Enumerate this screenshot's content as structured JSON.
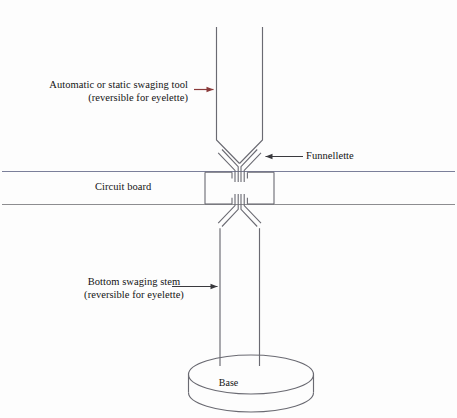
{
  "diagram": {
    "background_color": "#fdfdfd",
    "labels": {
      "tool": {
        "line1": "Automatic or static swaging tool",
        "line2": "(reversible for eyelette)"
      },
      "funnellette": "Funnellette",
      "circuit_board": "Circuit board",
      "stem": {
        "line1": "Bottom swaging stem",
        "line2": "(reversible for eyelette)"
      },
      "base": "Base"
    },
    "colors": {
      "outline": "#6a6a72",
      "outline_dark": "#4a4a52",
      "board_line_top": "#7b7f9a",
      "board_line_bottom": "#8d8d90",
      "arrow_tool": "#8a3a3a",
      "arrow_dark": "#3a3a3e",
      "text": "#141414"
    },
    "icon_names": [
      "arrow-left-icon",
      "arrow-right-icon",
      "swaging-tool-shape",
      "funnellette-shape",
      "circuit-board-lines",
      "swaging-stem-shape",
      "base-cylinder-shape"
    ]
  }
}
